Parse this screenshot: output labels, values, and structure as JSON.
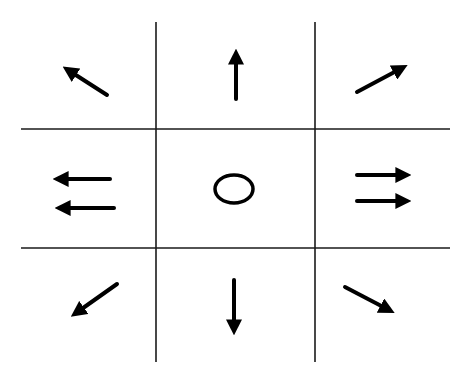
{
  "diagram": {
    "title": "",
    "type": "direction-grid",
    "size": {
      "width": 469,
      "height": 379
    },
    "colors": {
      "background": "#ffffff",
      "grid": "#1a1a1a",
      "symbol": "#000000"
    },
    "grid": {
      "rows": 3,
      "cols": 3,
      "vertical_lines": [
        {
          "x": 156,
          "y1": 22,
          "y2": 362
        },
        {
          "x": 315,
          "y1": 22,
          "y2": 362
        }
      ],
      "horizontal_lines": [
        {
          "y": 129,
          "x1": 21,
          "x2": 450
        },
        {
          "y": 248,
          "x1": 21,
          "x2": 450
        }
      ]
    },
    "cells": [
      {
        "position": "top-left",
        "symbol": "arrow",
        "direction": "up-left",
        "count": 1
      },
      {
        "position": "top-center",
        "symbol": "arrow",
        "direction": "up",
        "count": 1
      },
      {
        "position": "top-right",
        "symbol": "arrow",
        "direction": "up-right",
        "count": 1
      },
      {
        "position": "middle-left",
        "symbol": "double-arrow",
        "direction": "left",
        "count": 2
      },
      {
        "position": "center",
        "symbol": "circle",
        "direction": "none",
        "count": 1
      },
      {
        "position": "middle-right",
        "symbol": "double-arrow",
        "direction": "right",
        "count": 2
      },
      {
        "position": "bottom-left",
        "symbol": "arrow",
        "direction": "down-left",
        "count": 1
      },
      {
        "position": "bottom-center",
        "symbol": "arrow",
        "direction": "down",
        "count": 1
      },
      {
        "position": "bottom-right",
        "symbol": "arrow",
        "direction": "down-right",
        "count": 1
      }
    ]
  }
}
